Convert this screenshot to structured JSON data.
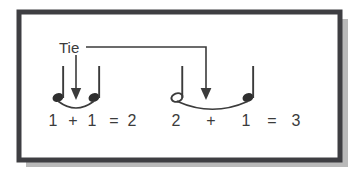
{
  "figure": {
    "title_label": "Tie",
    "frame": {
      "border_color": "#3e3e42",
      "fill_color": "#ffffff",
      "shadow_color": "#b9b9b9"
    },
    "ink_color": "#3b3b3b",
    "measures": [
      {
        "name": "measure-left",
        "notes": [
          {
            "type": "quarter-note",
            "head": "filled",
            "beats": "1"
          },
          {
            "type": "quarter-note",
            "head": "filled",
            "beats": "1"
          }
        ],
        "equation": {
          "terms": [
            "1",
            "1"
          ],
          "operator": "+",
          "equals": "=",
          "result": "2",
          "tokens": [
            "1",
            "+",
            "1",
            "=",
            "2"
          ]
        }
      },
      {
        "name": "measure-right",
        "notes": [
          {
            "type": "half-note",
            "head": "hollow",
            "beats": "2"
          },
          {
            "type": "quarter-note",
            "head": "filled",
            "beats": "1"
          }
        ],
        "equation": {
          "terms": [
            "2",
            "1"
          ],
          "operator": "+",
          "equals": "=",
          "result": "3",
          "tokens": [
            "2",
            "+",
            "1",
            "=",
            "3"
          ]
        }
      }
    ],
    "annotations": [
      {
        "name": "tie-arrow-left",
        "points_to": "tie-curve-left"
      },
      {
        "name": "tie-arrow-right",
        "points_to": "tie-curve-right"
      }
    ],
    "eq_left": {
      "t0": "1",
      "t1": "+",
      "t2": "1",
      "t3": "=",
      "t4": "2"
    },
    "eq_right": {
      "t0": "2",
      "t1": "+",
      "t2": "1",
      "t3": "=",
      "t4": "3"
    }
  }
}
